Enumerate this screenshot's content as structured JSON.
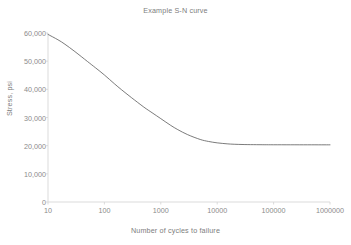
{
  "chart_data": {
    "type": "line",
    "title": "Example S-N curve",
    "xlabel": "Number of cycles to failure",
    "ylabel": "Stress, psi",
    "xscale": "log",
    "yscale": "linear",
    "xlim": [
      10,
      1000000
    ],
    "ylim": [
      0,
      60000
    ],
    "grid": false,
    "legend": false,
    "xticks": [
      10,
      100,
      1000,
      10000,
      100000,
      1000000
    ],
    "xtick_labels": [
      "10",
      "100",
      "1000",
      "10000",
      "100000",
      "1000000"
    ],
    "yticks": [
      0,
      10000,
      20000,
      30000,
      40000,
      50000,
      60000
    ],
    "ytick_labels": [
      "0",
      "10,000",
      "20,000",
      "30,000",
      "40,000",
      "50,000",
      "60,000"
    ],
    "series": [
      {
        "name": "S-N curve",
        "color": "#595959",
        "line_width": 0.8,
        "x": [
          10,
          15,
          20,
          30,
          50,
          70,
          100,
          150,
          200,
          300,
          500,
          700,
          1000,
          1500,
          2000,
          3000,
          5000,
          7000,
          10000,
          15000,
          20000,
          30000,
          50000,
          70000,
          100000,
          200000,
          400000,
          700000,
          1000000
        ],
        "y": [
          59500,
          57600,
          56000,
          53400,
          49900,
          47600,
          45100,
          42000,
          39900,
          37100,
          33700,
          31700,
          29600,
          27200,
          25700,
          23900,
          22200,
          21500,
          21000,
          20650,
          20500,
          20400,
          20350,
          20330,
          20320,
          20310,
          20305,
          20302,
          20300
        ]
      }
    ],
    "endurance_limit": 20300,
    "colors": {
      "axis": "#d7d7d7",
      "tick_mark": "#d7d7d7",
      "tick_text": "#8b8b8b",
      "title_text": "#7d7d7d",
      "curve": "#595959",
      "background": "#ffffff"
    }
  }
}
